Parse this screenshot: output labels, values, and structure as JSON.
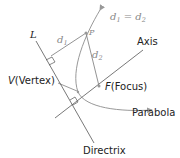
{
  "labels": {
    "L": "L",
    "d1": "d",
    "d1_sub": "1",
    "P": "P",
    "d2": "d",
    "d2_sub": "2",
    "equation_d1": "d",
    "equation_d1_sub": "1",
    "equation_eq": " = ",
    "equation_d2": "d",
    "equation_d2_sub": "2",
    "axis": "Axis",
    "vertex_italic": "V",
    "vertex_text": "(Vertex)",
    "focus_italic": "F",
    "focus_text": "(Focus)",
    "parabola": "Parabola",
    "directrix": "Directrix"
  },
  "colors": {
    "line": "#555555",
    "curve": "#999999",
    "text": "#222222",
    "muted_text": "#888888"
  }
}
